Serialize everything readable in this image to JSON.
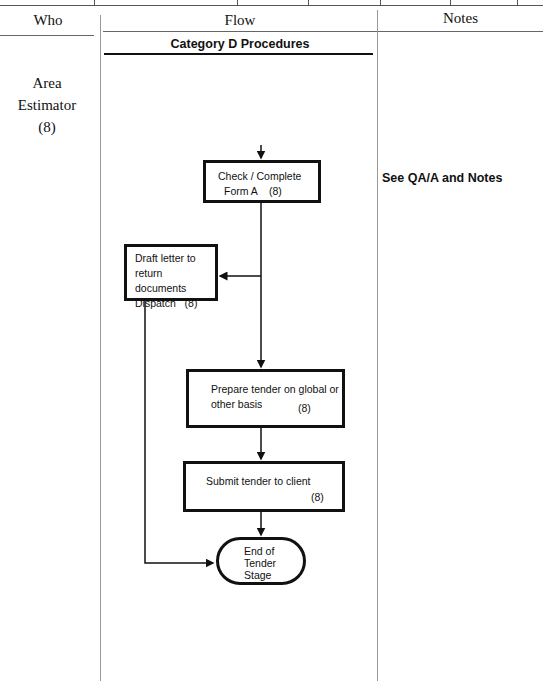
{
  "table_header": {
    "who_label": "Who",
    "flow_label": "Flow",
    "notes_label": "Notes"
  },
  "section_title": "Category D Procedures",
  "who": {
    "line1": "Area",
    "line2": "Estimator",
    "line3": "(8)"
  },
  "flow": {
    "nodes": [
      {
        "id": "check-form",
        "lines": [
          "Check / Complete",
          "Form A    (8)"
        ]
      },
      {
        "id": "draft-letter",
        "lines": [
          "Draft letter to",
          "return documents",
          "Dispatch   (8)"
        ]
      },
      {
        "id": "prepare-tender",
        "lines": [
          "Prepare tender on global or",
          "other basis"
        ],
        "ref": "(8)"
      },
      {
        "id": "submit-tender",
        "lines": [
          "Submit tender to client"
        ],
        "ref": "(8)"
      },
      {
        "id": "end",
        "lines": [
          "End of",
          "Tender",
          "Stage"
        ]
      }
    ]
  },
  "notes": {
    "text": "See QA/A and Notes"
  },
  "colors": {
    "line": "#111111",
    "divider": "#999999"
  }
}
